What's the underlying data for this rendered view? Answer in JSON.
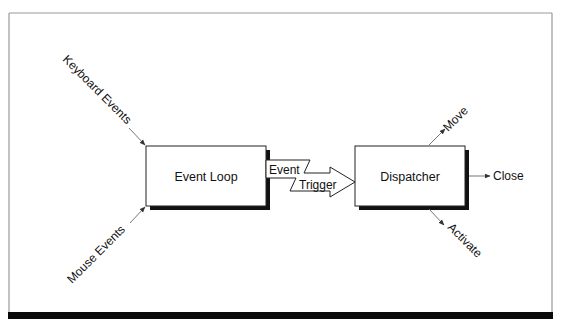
{
  "diagram": {
    "type": "event-flow",
    "nodes": {
      "event_loop": {
        "label": "Event Loop"
      },
      "dispatcher": {
        "label": "Dispatcher"
      }
    },
    "inputs": [
      {
        "label": "Keyboard Events",
        "target": "event_loop"
      },
      {
        "label": "Mouse Events",
        "target": "event_loop"
      }
    ],
    "connector": {
      "label_top": "Event",
      "label_bottom": "Trigger",
      "from": "event_loop",
      "to": "dispatcher"
    },
    "outputs": [
      {
        "label": "Move",
        "source": "dispatcher"
      },
      {
        "label": "Close",
        "source": "dispatcher"
      },
      {
        "label": "Activate",
        "source": "dispatcher"
      }
    ],
    "colors": {
      "ink": "#111111",
      "frame": "#9a9a9a",
      "arrow_line": "#777777",
      "background": "#ffffff"
    }
  }
}
